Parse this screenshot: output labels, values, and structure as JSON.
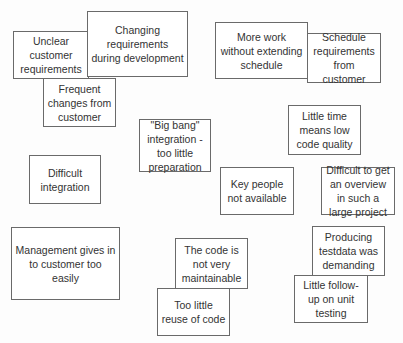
{
  "diagram": {
    "type": "affinity-notes",
    "notes": [
      {
        "id": "unclear-customer-requirements",
        "text": "Unclear customer requirements",
        "x": 13,
        "y": 31,
        "w": 76,
        "h": 48,
        "z": 1
      },
      {
        "id": "changing-requirements",
        "text": "Changing requirements during development",
        "x": 87,
        "y": 11,
        "w": 101,
        "h": 66,
        "z": 2
      },
      {
        "id": "frequent-changes",
        "text": "Frequent changes from customer",
        "x": 43,
        "y": 78,
        "w": 73,
        "h": 49,
        "z": 3
      },
      {
        "id": "more-work-without-schedule",
        "text": "More work without extending schedule",
        "x": 215,
        "y": 22,
        "w": 93,
        "h": 57,
        "z": 1
      },
      {
        "id": "schedule-requirements",
        "text": "Schedule requirements from customer",
        "x": 307,
        "y": 33,
        "w": 74,
        "h": 50,
        "z": 2
      },
      {
        "id": "big-bang-integration",
        "text": "\"Big bang\" integration - too little preparation",
        "x": 139,
        "y": 119,
        "w": 72,
        "h": 53,
        "z": 1
      },
      {
        "id": "little-time-low-quality",
        "text": "Little time means low code quality",
        "x": 288,
        "y": 105,
        "w": 73,
        "h": 50,
        "z": 1
      },
      {
        "id": "difficult-integration",
        "text": "Difficult integration",
        "x": 29,
        "y": 155,
        "w": 72,
        "h": 49,
        "z": 1
      },
      {
        "id": "key-people-not-available",
        "text": "Key people not available",
        "x": 220,
        "y": 167,
        "w": 74,
        "h": 48,
        "z": 1
      },
      {
        "id": "difficult-overview",
        "text": "Difficult to get an overview in such a large project",
        "x": 321,
        "y": 167,
        "w": 74,
        "h": 48,
        "z": 1
      },
      {
        "id": "management-gives-in",
        "text": "Management gives in to customer too easily",
        "x": 11,
        "y": 227,
        "w": 109,
        "h": 73,
        "z": 1
      },
      {
        "id": "code-not-maintainable",
        "text": "The code is not very maintainable",
        "x": 175,
        "y": 238,
        "w": 73,
        "h": 51,
        "z": 1
      },
      {
        "id": "too-little-reuse",
        "text": "Too little reuse of code",
        "x": 157,
        "y": 288,
        "w": 73,
        "h": 48,
        "z": 2
      },
      {
        "id": "producing-testdata",
        "text": "Producing testdata was demanding",
        "x": 312,
        "y": 226,
        "w": 73,
        "h": 50,
        "z": 1
      },
      {
        "id": "little-follow-up",
        "text": "Little follow-up on unit testing",
        "x": 294,
        "y": 275,
        "w": 74,
        "h": 48,
        "z": 2
      }
    ],
    "colors": {
      "border": "#6a6a6a",
      "note_fill": "#ffffff",
      "text": "#333333",
      "background": "#fdfdfd"
    }
  }
}
